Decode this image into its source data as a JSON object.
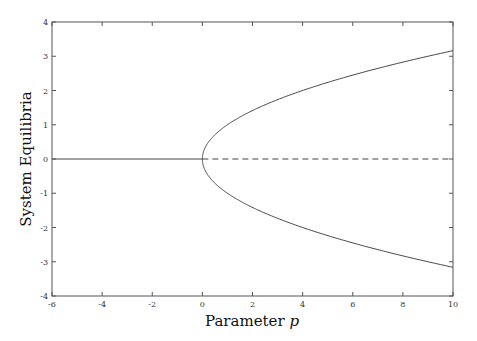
{
  "chart_data": {
    "type": "line",
    "title": "",
    "xlabel": "Parameter p",
    "xlabel_main": "Parameter ",
    "xlabel_var": "p",
    "ylabel": "System Equilibria",
    "xlim": [
      -6,
      10
    ],
    "ylim": [
      -4,
      4
    ],
    "xticks": [
      -6,
      -4,
      -2,
      0,
      2,
      4,
      6,
      8,
      10
    ],
    "yticks": [
      -4,
      -3,
      -2,
      -1,
      0,
      1,
      2,
      3,
      4
    ],
    "grid": false,
    "legend": null,
    "series": [
      {
        "name": "stable zero branch (p<0)",
        "style": "solid",
        "x": [
          -6,
          0
        ],
        "y": [
          0,
          0
        ]
      },
      {
        "name": "unstable zero branch (p>0)",
        "style": "dashed",
        "x": [
          0,
          10
        ],
        "y": [
          0,
          0
        ]
      },
      {
        "name": "upper branch +sqrt(p)",
        "style": "solid",
        "x": [
          0,
          0.25,
          1,
          2,
          4,
          6,
          8,
          10
        ],
        "y": [
          0,
          0.5,
          1,
          1.414,
          2,
          2.449,
          2.828,
          3.162
        ]
      },
      {
        "name": "lower branch -sqrt(p)",
        "style": "solid",
        "x": [
          0,
          0.25,
          1,
          2,
          4,
          6,
          8,
          10
        ],
        "y": [
          0,
          -0.5,
          -1,
          -1.414,
          -2,
          -2.449,
          -2.828,
          -3.162
        ]
      }
    ],
    "line_color": "#444444"
  }
}
